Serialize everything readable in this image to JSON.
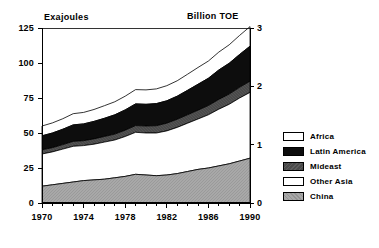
{
  "chart_data": {
    "type": "area",
    "stacked": true,
    "title": "",
    "xlabel": "",
    "ylabel": "Exajoules",
    "y2label": "Billion TOE",
    "grid": false,
    "legend_position": "right",
    "xlim": [
      1970,
      1990
    ],
    "ylim": [
      0,
      125
    ],
    "y2lim": [
      0,
      3
    ],
    "x_tick_labels": [
      "1970",
      "1974",
      "1978",
      "1982",
      "1986",
      "1990"
    ],
    "x_tick_values": [
      1970,
      1974,
      1978,
      1982,
      1986,
      1990
    ],
    "x_minor_tick_interval": 1,
    "y_tick_labels": [
      "0",
      "25",
      "50",
      "75",
      "100",
      "125"
    ],
    "y_tick_values": [
      0,
      25,
      50,
      75,
      100,
      125
    ],
    "y2_tick_labels": [
      "0",
      "1",
      "2",
      "3"
    ],
    "y2_tick_values": [
      0,
      1,
      2,
      3
    ],
    "x": [
      1970,
      1971,
      1972,
      1973,
      1974,
      1975,
      1976,
      1977,
      1978,
      1979,
      1980,
      1981,
      1982,
      1983,
      1984,
      1985,
      1986,
      1987,
      1988,
      1989,
      1990
    ],
    "series": [
      {
        "name": "China",
        "color": "#a8a8a8",
        "pattern": "hatch",
        "values": [
          12,
          13,
          14,
          15,
          16,
          16.5,
          17,
          18,
          19,
          20.5,
          20,
          19.5,
          20,
          21,
          22.5,
          24,
          25,
          26.5,
          28,
          30,
          32
        ]
      },
      {
        "name": "Other Asia",
        "color": "#ffffff",
        "pattern": "solid",
        "values": [
          23,
          23.5,
          24.5,
          25.5,
          25,
          25.5,
          26.5,
          27,
          28.5,
          30,
          30,
          30.5,
          31.5,
          33,
          34.5,
          36,
          38,
          40.5,
          42.5,
          45,
          47
        ]
      },
      {
        "name": "Mideast",
        "color": "#4a4a4a",
        "pattern": "solid",
        "values": [
          3,
          3,
          3.2,
          3.5,
          3.5,
          3.8,
          4,
          4.2,
          4.5,
          4.8,
          5,
          5.2,
          5.5,
          5.8,
          6,
          6.3,
          6.6,
          7,
          7.3,
          7.6,
          8
        ]
      },
      {
        "name": "Latin America",
        "color": "#0d0d0d",
        "pattern": "solid",
        "values": [
          10,
          10.5,
          11,
          11.8,
          12,
          12.5,
          13,
          13.8,
          14.5,
          15.5,
          15.5,
          15.8,
          16,
          16.5,
          17.5,
          18.5,
          19.5,
          21,
          22,
          23.5,
          25
        ]
      },
      {
        "name": "Africa",
        "color": "#ffffff",
        "pattern": "solid",
        "values": [
          7,
          7.2,
          7.5,
          8,
          8.2,
          8.5,
          9,
          9.3,
          9.8,
          10.2,
          10.3,
          10.5,
          10.8,
          11,
          11.5,
          12,
          12.3,
          12.8,
          13.2,
          13.6,
          14
        ]
      }
    ],
    "totals": [
      55,
      57.2,
      60.2,
      63.8,
      64.7,
      66.8,
      69.5,
      72.3,
      76.3,
      81,
      80.8,
      81.5,
      83.8,
      87.3,
      92,
      96.8,
      101.4,
      107.8,
      113,
      119.7,
      126
    ]
  },
  "legend": {
    "items": [
      {
        "label": "Africa",
        "swatch_class": "fill-africa"
      },
      {
        "label": "Latin America",
        "swatch_class": "fill-latin-america"
      },
      {
        "label": "Mideast",
        "swatch_class": "fill-mideast"
      },
      {
        "label": "Other Asia",
        "swatch_class": "fill-other-asia"
      },
      {
        "label": "China",
        "swatch_class": "fill-china"
      }
    ]
  }
}
